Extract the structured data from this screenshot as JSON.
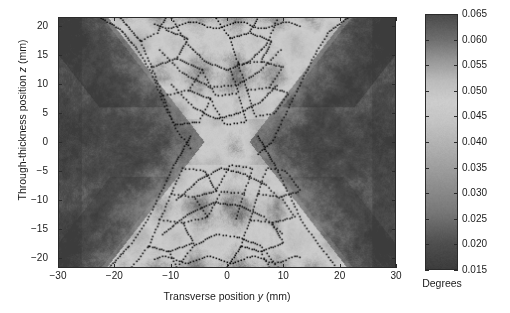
{
  "figure": {
    "kind": "heatmap-with-contours",
    "background": "#ffffff"
  },
  "axes": {
    "xlabel_prefix": "Transverse position ",
    "xlabel_var": "y",
    "xlabel_suffix": " (mm)",
    "ylabel_prefix": "Through-thickness position ",
    "ylabel_var": "z",
    "ylabel_suffix": " (mm)",
    "x_ticks": [
      "-30",
      "-20",
      "-10",
      "0",
      "10",
      "20",
      "30"
    ],
    "y_ticks": [
      "20",
      "15",
      "10",
      "5",
      "0",
      "-5",
      "-10",
      "-15",
      "-20"
    ]
  },
  "colorbar": {
    "title": "Degrees",
    "ticks": [
      "0.065",
      "0.060",
      "0.055",
      "0.050",
      "0.045",
      "0.040",
      "0.035",
      "0.030",
      "0.025",
      "0.020",
      "0.015"
    ],
    "vmin": 0.015,
    "vmax": 0.065
  },
  "colors": {
    "axis_line": "#2b2b2b",
    "text": "#1a1a1a",
    "contour": "#111111",
    "map_dark": "#4a4a4a",
    "map_light": "#d8d8d8"
  },
  "chart_data": {
    "type": "heatmap",
    "title": "",
    "xlabel": "Transverse position y (mm)",
    "ylabel": "Through-thickness position z (mm)",
    "zlabel": "Degrees",
    "xlim": [
      -30,
      30
    ],
    "ylim": [
      -21.7,
      21.5
    ],
    "zlim": [
      0.015,
      0.065
    ],
    "grid": false,
    "colormap": "gray-cyclic",
    "x_tick_values": [
      -30,
      -20,
      -10,
      0,
      10,
      20,
      30
    ],
    "y_tick_values": [
      20,
      15,
      10,
      5,
      0,
      -5,
      -10,
      -15,
      -20
    ],
    "colorbar_tick_values": [
      0.065,
      0.06,
      0.055,
      0.05,
      0.045,
      0.04,
      0.035,
      0.03,
      0.025,
      0.02,
      0.015
    ],
    "regions": [
      {
        "name": "left-parent",
        "x_range": [
          -30,
          -22
        ],
        "z_range": [
          -21.7,
          21.5
        ],
        "value": 0.026
      },
      {
        "name": "right-parent",
        "x_range": [
          22,
          30
        ],
        "z_range": [
          -21.7,
          21.5
        ],
        "value": 0.026
      },
      {
        "name": "upper-weld-fill",
        "x_range": [
          -14,
          14
        ],
        "z_range": [
          2,
          21.5
        ],
        "value": 0.05
      },
      {
        "name": "lower-weld-fill",
        "x_range": [
          -14,
          14
        ],
        "z_range": [
          -21.7,
          -2
        ],
        "value": 0.05
      },
      {
        "name": "weld-root",
        "x_range": [
          -4,
          4
        ],
        "z_range": [
          -3,
          3
        ],
        "value": 0.044
      },
      {
        "name": "upper-left-haz",
        "x_range": [
          -26,
          -14
        ],
        "z_range": [
          6,
          21.5
        ],
        "value": 0.019
      },
      {
        "name": "upper-right-haz",
        "x_range": [
          14,
          26
        ],
        "z_range": [
          6,
          21.5
        ],
        "value": 0.021
      }
    ],
    "bead_contours": [
      {
        "name": "upper-left-fusion-boundary",
        "points": [
          [
            -22.5,
            21.5
          ],
          [
            -19,
            19.5
          ],
          [
            -16,
            16
          ],
          [
            -13.5,
            12
          ],
          [
            -11.5,
            7
          ],
          [
            -9,
            2
          ],
          [
            -6.5,
            -1
          ]
        ]
      },
      {
        "name": "upper-right-fusion-boundary",
        "points": [
          [
            21.5,
            21.5
          ],
          [
            18,
            19
          ],
          [
            15.5,
            15
          ],
          [
            13,
            10
          ],
          [
            10.5,
            5
          ],
          [
            8,
            0
          ],
          [
            5.5,
            -2
          ]
        ]
      },
      {
        "name": "lower-left-fusion-boundary",
        "points": [
          [
            -6.5,
            1
          ],
          [
            -9.5,
            -4
          ],
          [
            -12,
            -9
          ],
          [
            -14.5,
            -14
          ],
          [
            -17.5,
            -18
          ],
          [
            -21,
            -21.7
          ]
        ]
      },
      {
        "name": "lower-right-fusion-boundary",
        "points": [
          [
            5.5,
            1
          ],
          [
            8.5,
            -4
          ],
          [
            11,
            -9
          ],
          [
            13.5,
            -14
          ],
          [
            16.5,
            -18
          ],
          [
            19.5,
            -21.7
          ]
        ]
      },
      {
        "name": "upper-bead-pass-1",
        "points": [
          [
            -10,
            21.5
          ],
          [
            -7,
            17
          ],
          [
            -4,
            14
          ],
          [
            0,
            12.5
          ],
          [
            4,
            14
          ],
          [
            7,
            17
          ],
          [
            9,
            21.5
          ]
        ]
      },
      {
        "name": "upper-bead-pass-2",
        "points": [
          [
            -12,
            16
          ],
          [
            -8,
            12
          ],
          [
            -3,
            9.5
          ],
          [
            2,
            10
          ],
          [
            6,
            12.5
          ],
          [
            9.5,
            16
          ]
        ]
      },
      {
        "name": "upper-bead-pass-3",
        "points": [
          [
            -10,
            10
          ],
          [
            -6,
            6
          ],
          [
            -2,
            4
          ],
          [
            2,
            5
          ],
          [
            6,
            7
          ],
          [
            9,
            10
          ]
        ]
      },
      {
        "name": "lower-bead-pass-1",
        "points": [
          [
            -9,
            -21.7
          ],
          [
            -6,
            -18
          ],
          [
            -2,
            -16
          ],
          [
            2,
            -16.5
          ],
          [
            6,
            -18
          ],
          [
            9,
            -21.7
          ]
        ]
      },
      {
        "name": "lower-bead-pass-2",
        "points": [
          [
            -11.5,
            -16
          ],
          [
            -7,
            -12.5
          ],
          [
            -2.5,
            -10.5
          ],
          [
            2,
            -11
          ],
          [
            6.5,
            -13
          ],
          [
            10,
            -16
          ]
        ]
      },
      {
        "name": "lower-bead-pass-3",
        "points": [
          [
            -9,
            -10
          ],
          [
            -5,
            -6.5
          ],
          [
            -1,
            -4.5
          ],
          [
            3,
            -5.5
          ],
          [
            7,
            -7.5
          ],
          [
            9.5,
            -10
          ]
        ]
      }
    ]
  }
}
